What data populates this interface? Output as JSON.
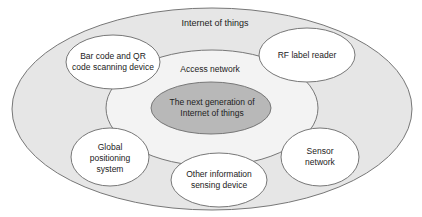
{
  "diagram": {
    "outer": {
      "label": "Internet of things",
      "fill": "#e6e6e6"
    },
    "access": {
      "label": "Access network",
      "fill": "#f2f2f2"
    },
    "core": {
      "label": "The next generation of Internet of things",
      "fill": "#b8b8b8"
    },
    "nodes": [
      {
        "id": "barcode",
        "label": "Bar code and QR code scanning device"
      },
      {
        "id": "rf",
        "label": "RF label reader"
      },
      {
        "id": "gps",
        "label": "Global positioning system"
      },
      {
        "id": "other",
        "label": "Other information sensing device"
      },
      {
        "id": "sensor",
        "label": "Sensor network"
      }
    ],
    "stroke": "#777777"
  }
}
